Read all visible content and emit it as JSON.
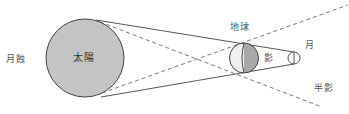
{
  "title": "月蝕",
  "labels": {
    "eclipse": "月蝕",
    "sun": "太陽",
    "earth": "地球",
    "umbra": "影",
    "moon": "月",
    "penumbra": "半影"
  },
  "colors": {
    "sun_fill": "#c4c4c4",
    "earth_day": "#efefef",
    "earth_shadow": "#a8a8a8",
    "line": "#444444",
    "dashed": "#666666"
  },
  "diagram_type": "lunar eclipse geometry: sun, earth, moon with umbra and penumbra cones"
}
